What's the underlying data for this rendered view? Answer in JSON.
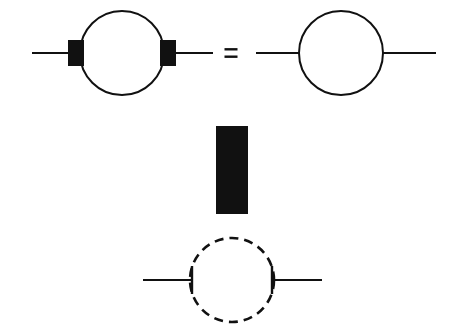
{
  "figure": {
    "canvas": {
      "width": 460,
      "height": 329,
      "background": "#ffffff"
    },
    "ink_color": "#111111",
    "line_width": 2.1,
    "loop_line_width": 2.0
  },
  "relation": {
    "operator_symbol": "=",
    "operator_name": "equals-sign",
    "operator_x": 231,
    "operator_y": 53,
    "bar_width": 13,
    "bar_height": 2.4,
    "bar_gap": 5
  },
  "diagrams": [
    {
      "id": "lhs-loop-with-vertex-insertions",
      "name": "left-hand-side-diagram",
      "label": "loop with two filled vertex insertions",
      "loop": {
        "style": "solid",
        "cx": 122,
        "cy": 53,
        "r": 42,
        "stroke_width": 2.0
      },
      "legs": [
        {
          "name": "incoming-leg",
          "x1": 32,
          "y1": 53,
          "x2": 70,
          "y2": 53,
          "stroke_width": 2.2
        },
        {
          "name": "outgoing-leg",
          "x1": 175,
          "y1": 53,
          "x2": 213,
          "y2": 53,
          "stroke_width": 2.2
        }
      ],
      "vertex_blobs": [
        {
          "name": "left-vertex-blob",
          "x": 68,
          "y": 40,
          "width": 16,
          "height": 26
        },
        {
          "name": "right-vertex-blob",
          "x": 160,
          "y": 40,
          "width": 16,
          "height": 26
        }
      ]
    },
    {
      "id": "rhs-plain-loop",
      "name": "right-hand-side-diagram",
      "label": "plain one-loop propagator correction",
      "loop": {
        "style": "solid",
        "cx": 341,
        "cy": 53,
        "r": 42,
        "stroke_width": 2.0
      },
      "legs": [
        {
          "name": "incoming-leg",
          "x1": 256,
          "y1": 53,
          "x2": 300,
          "y2": 53,
          "stroke_width": 2.2
        },
        {
          "name": "outgoing-leg",
          "x1": 382,
          "y1": 53,
          "x2": 436,
          "y2": 53,
          "stroke_width": 2.2
        }
      ],
      "vertex_blobs": []
    },
    {
      "id": "mass-insertion-blob",
      "name": "center-filled-rectangle",
      "label": "solid filled vertex / mass insertion block",
      "rect": {
        "x": 216,
        "y": 126,
        "width": 32,
        "height": 88
      }
    },
    {
      "id": "ghost-dashed-loop",
      "name": "bottom-dashed-loop-diagram",
      "label": "dashed (ghost or scalar) loop with solid external legs",
      "loop": {
        "style": "dashed",
        "cx": 232,
        "cy": 280,
        "r": 42,
        "stroke_width": 2.6,
        "dash_length": 9,
        "dash_gap": 6
      },
      "legs": [
        {
          "name": "incoming-leg",
          "x1": 143,
          "y1": 280,
          "x2": 192,
          "y2": 280,
          "stroke_width": 2.2
        },
        {
          "name": "outgoing-leg",
          "x1": 272,
          "y1": 280,
          "x2": 322,
          "y2": 280,
          "stroke_width": 2.2
        }
      ],
      "end_ticks": [
        {
          "name": "left-end-tick",
          "x": 192,
          "y1": 266,
          "y2": 294,
          "stroke_width": 2.4
        },
        {
          "name": "right-end-tick",
          "x": 272,
          "y1": 266,
          "y2": 294,
          "stroke_width": 2.4
        }
      ]
    }
  ]
}
